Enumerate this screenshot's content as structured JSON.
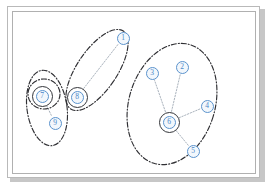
{
  "figure": {
    "frame": {
      "style": "double-bordered framed figure with drop shadow",
      "border_color": "#b0b0b0",
      "background": "#ffffff"
    },
    "legend_note": "",
    "colors": {
      "node_stroke": "#5b93cd",
      "node_fill": "#f2f7fc",
      "node_text": "#4a86c8",
      "hub_ring": "#33353a",
      "cluster_outline": "#2f2f33",
      "edge": "#9aa4b0"
    },
    "nodes": [
      {
        "id": "1",
        "label": "1",
        "x": 123,
        "y": 38,
        "hub": false,
        "cluster": "B"
      },
      {
        "id": "2",
        "label": "2",
        "x": 182,
        "y": 67,
        "hub": false,
        "cluster": "C"
      },
      {
        "id": "3",
        "label": "3",
        "x": 152,
        "y": 73,
        "hub": false,
        "cluster": "C"
      },
      {
        "id": "4",
        "label": "4",
        "x": 207,
        "y": 106,
        "hub": false,
        "cluster": "C"
      },
      {
        "id": "5",
        "label": "5",
        "x": 193,
        "y": 151,
        "hub": false,
        "cluster": "C"
      },
      {
        "id": "6",
        "label": "6",
        "x": 169,
        "y": 122,
        "hub": true,
        "cluster": "C"
      },
      {
        "id": "7",
        "label": "7",
        "x": 42,
        "y": 96,
        "hub": true,
        "cluster": "A"
      },
      {
        "id": "8",
        "label": "8",
        "x": 77,
        "y": 97,
        "hub": true,
        "cluster": "B"
      },
      {
        "id": "9",
        "label": "9",
        "x": 55,
        "y": 123,
        "hub": false,
        "cluster": "A"
      }
    ],
    "edges": [
      {
        "from": "7",
        "to": "9"
      },
      {
        "from": "8",
        "to": "1"
      },
      {
        "from": "6",
        "to": "2"
      },
      {
        "from": "6",
        "to": "3"
      },
      {
        "from": "6",
        "to": "4"
      },
      {
        "from": "6",
        "to": "5"
      }
    ],
    "clusters": [
      {
        "id": "A",
        "name": "cluster-left",
        "cx": 47,
        "cy": 108,
        "rx": 20,
        "ry": 38,
        "rotation": -8,
        "members": [
          "7",
          "9"
        ]
      },
      {
        "id": "B",
        "name": "cluster-middle",
        "cx": 97,
        "cy": 70,
        "rx": 20,
        "ry": 47,
        "rotation": 34,
        "members": [
          "8",
          "1"
        ]
      },
      {
        "id": "C",
        "name": "cluster-right",
        "cx": 172,
        "cy": 104,
        "rx": 43,
        "ry": 62,
        "rotation": 17,
        "members": [
          "2",
          "3",
          "4",
          "5",
          "6"
        ]
      },
      {
        "id": "A2",
        "name": "cluster-left-inner",
        "cx": 44,
        "cy": 94,
        "rx": 16,
        "ry": 15,
        "rotation": 0,
        "members": [
          "7"
        ]
      }
    ]
  }
}
